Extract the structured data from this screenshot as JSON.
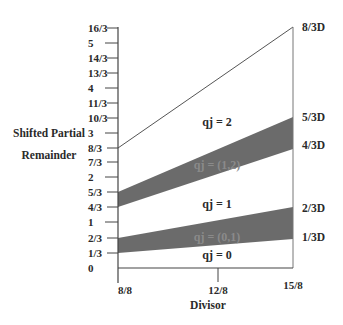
{
  "diagram": {
    "type": "p-d-plot",
    "y_axis": {
      "title_line1": "Shifted Partial",
      "title_line2": "Remainder",
      "ticks": [
        {
          "label": "16/3",
          "value": 5.3333
        },
        {
          "label": "5",
          "value": 5
        },
        {
          "label": "14/3",
          "value": 4.6667
        },
        {
          "label": "13/3",
          "value": 4.3333
        },
        {
          "label": "4",
          "value": 4
        },
        {
          "label": "11/3",
          "value": 3.6667
        },
        {
          "label": "10/3",
          "value": 3.3333
        },
        {
          "label": "3",
          "value": 3
        },
        {
          "label": "8/3",
          "value": 2.6667
        },
        {
          "label": "7/3",
          "value": 2.3333
        },
        {
          "label": "2",
          "value": 2
        },
        {
          "label": "5/3",
          "value": 1.6667
        },
        {
          "label": "4/3",
          "value": 1.3333
        },
        {
          "label": "1",
          "value": 1
        },
        {
          "label": "2/3",
          "value": 0.6667
        },
        {
          "label": "1/3",
          "value": 0.3333
        },
        {
          "label": "0",
          "value": 0
        }
      ]
    },
    "x_axis": {
      "title": "Divisor",
      "ticks": [
        {
          "label": "8/8",
          "value": 1.0
        },
        {
          "label": "12/8",
          "value": 1.5
        },
        {
          "label": "15/8",
          "value": 1.875
        }
      ]
    },
    "boundary_lines": [
      {
        "label": "8/3D"
      },
      {
        "label": "5/3D"
      },
      {
        "label": "4/3D"
      },
      {
        "label": "2/3D"
      },
      {
        "label": "1/3D"
      }
    ],
    "regions": [
      {
        "label": "qj = 2"
      },
      {
        "label": "qj = (1,2)"
      },
      {
        "label": "qj = 1"
      },
      {
        "label": "qj = (0,1)"
      },
      {
        "label": "qj = 0"
      }
    ],
    "colors": {
      "band_fill": "#5e5e5e",
      "line": "#555555",
      "background": "#ffffff"
    }
  }
}
